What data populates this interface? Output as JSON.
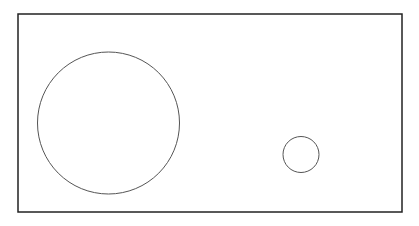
{
  "canvas": {
    "width": 419,
    "height": 226,
    "background": "#ffffff"
  },
  "frame": {
    "x": 18,
    "y": 14,
    "width": 384,
    "height": 198,
    "stroke": "#222222",
    "stroke_width": 1.5
  },
  "shapes": [
    {
      "type": "circle",
      "name": "large-circle",
      "cx": 108.5,
      "cy": 123,
      "r": 71,
      "stroke": "#555555",
      "stroke_width": 1
    },
    {
      "type": "circle",
      "name": "small-circle",
      "cx": 301,
      "cy": 154.5,
      "r": 18,
      "stroke": "#555555",
      "stroke_width": 1
    }
  ]
}
